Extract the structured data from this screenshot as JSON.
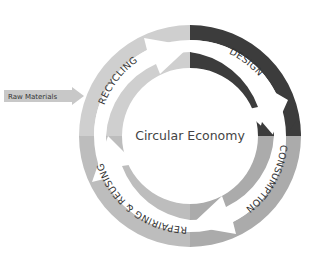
{
  "diagram": {
    "title": "Circular Economy",
    "stages": [
      {
        "label": "DESIGN",
        "color": "#3c3c3c"
      },
      {
        "label": "CONSUMPTION",
        "color": "#ababab"
      },
      {
        "label": "REPAIRING & REUSING",
        "color": "#bdbdbd"
      },
      {
        "label": "RECYCLING",
        "color": "#cfcfcf"
      }
    ],
    "input": {
      "label": "Raw Materials",
      "color": "#c8c8c8"
    }
  }
}
